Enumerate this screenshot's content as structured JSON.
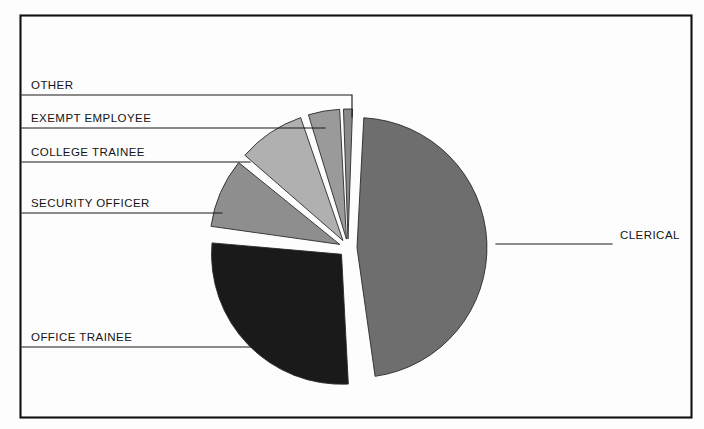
{
  "figure": {
    "kind": "pie-chart-figure",
    "background_color": "#fdfdfd",
    "frame_color": "#111111",
    "leader_color": "#1b1b1b",
    "text_color": "#141414"
  },
  "chart_data": {
    "type": "pie",
    "title": "",
    "subtitle": "",
    "xlabel": "",
    "ylabel": "",
    "grid": false,
    "legend_position": "callout-labels",
    "exploded": true,
    "start_angle_deg": -90,
    "direction": "clockwise",
    "center": {
      "x": 348,
      "y": 248
    },
    "radius": 130,
    "labels": [
      "CLERICAL",
      "OFFICE TRAINEE",
      "SECURITY OFFICER",
      "COLLEGE TRAINEE",
      "EXEMPT EMPLOYEE",
      "OTHER"
    ],
    "values": [
      47,
      27,
      9,
      9,
      5,
      3
    ],
    "colors": [
      "#6e6e6e",
      "#1a1a1a",
      "#8e8e8e",
      "#b0b0b0",
      "#9a9a9a",
      "#8a8a8a"
    ],
    "slices": [
      {
        "name": "CLERICAL",
        "value": 47,
        "percent": "47%",
        "color": "#6e6e6e",
        "start_deg": 3,
        "end_deg": 172,
        "explode": 9,
        "label": "CLERICAL",
        "label_x": 620,
        "label_y": 239,
        "label_anchor": "start",
        "leader_path": "M 612 244 L 496 244"
      },
      {
        "name": "OFFICE TRAINEE",
        "value": 27,
        "percent": "27%",
        "color": "#1a1a1a",
        "start_deg": 177,
        "end_deg": 275,
        "explode": 9,
        "label": "OFFICE TRAINEE",
        "label_x": 31,
        "label_y": 341,
        "label_anchor": "start",
        "leader_path": "M 22 347 L 253 347"
      },
      {
        "name": "SECURITY OFFICER",
        "value": 9,
        "percent": "9%",
        "color": "#8e8e8e",
        "start_deg": 278,
        "end_deg": 309,
        "explode": 9,
        "label": "SECURITY OFFICER",
        "label_x": 31,
        "label_y": 207,
        "label_anchor": "start",
        "leader_path": "M 22 213 L 222 213"
      },
      {
        "name": "COLLEGE TRAINEE",
        "value": 9,
        "percent": "9%",
        "color": "#b0b0b0",
        "start_deg": 311,
        "end_deg": 341,
        "explode": 9,
        "label": "COLLEGE TRAINEE",
        "label_x": 31,
        "label_y": 156,
        "label_anchor": "start",
        "leader_path": "M 22 162 L 250 162"
      },
      {
        "name": "EXEMPT EMPLOYEE",
        "value": 5,
        "percent": "5%",
        "color": "#9a9a9a",
        "start_deg": 343,
        "end_deg": 357,
        "explode": 9,
        "label": "EXEMPT EMPLOYEE",
        "label_x": 31,
        "label_y": 122,
        "label_anchor": "start",
        "leader_path": "M 22 128 L 325 128"
      },
      {
        "name": "OTHER",
        "value": 3,
        "percent": "3%",
        "color": "#8a8a8a",
        "start_deg": 358,
        "end_deg": 362,
        "explode": 9,
        "label": "OTHER",
        "label_x": 31,
        "label_y": 89,
        "label_anchor": "start",
        "leader_path": "M 22 95 L 352 95 L 352 117"
      }
    ]
  }
}
